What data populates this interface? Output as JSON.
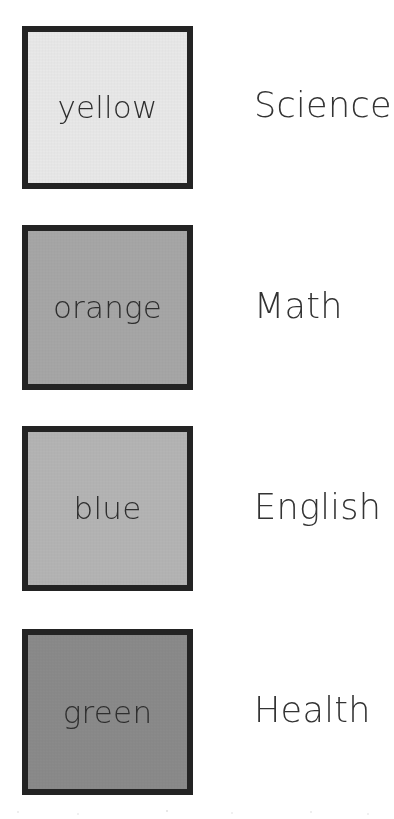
{
  "page": {
    "background_color": "#ffffff",
    "text_color": "#333333",
    "border_color": "#232323"
  },
  "rows": [
    {
      "color_name": "yellow",
      "subject": "Science",
      "swatch_fill_hex": "#e8e8e8",
      "swatch_name": "swatch-yellow"
    },
    {
      "color_name": "orange",
      "subject": "Math",
      "swatch_fill_hex": "#a6a6a6",
      "swatch_name": "swatch-orange"
    },
    {
      "color_name": "blue",
      "subject": "English",
      "swatch_fill_hex": "#b4b4b4",
      "swatch_name": "swatch-blue"
    },
    {
      "color_name": "green",
      "subject": "Health",
      "swatch_fill_hex": "#8a8a8a",
      "swatch_name": "swatch-green"
    }
  ]
}
